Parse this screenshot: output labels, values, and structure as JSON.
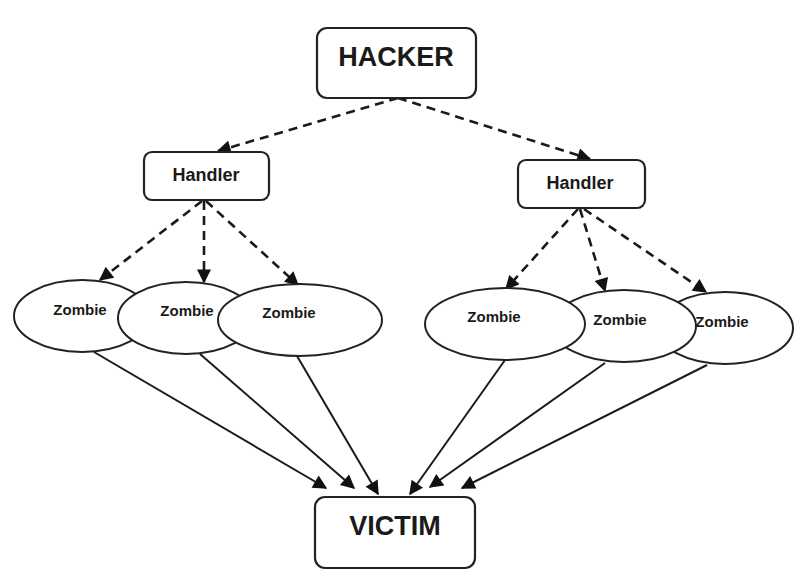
{
  "diagram": {
    "type": "DDoS attack hierarchy",
    "nodes": {
      "hacker": {
        "label": "HACKER"
      },
      "handler_left": {
        "label": "Handler"
      },
      "handler_right": {
        "label": "Handler"
      },
      "zombies_left": [
        {
          "label": "Zombie"
        },
        {
          "label": "Zombie"
        },
        {
          "label": "Zombie"
        }
      ],
      "zombies_right": [
        {
          "label": "Zombie"
        },
        {
          "label": "Zombie"
        },
        {
          "label": "Zombie"
        }
      ],
      "victim": {
        "label": "VICTIM"
      }
    },
    "edges": [
      {
        "from": "HACKER",
        "to": "Handler (left)",
        "style": "dashed"
      },
      {
        "from": "HACKER",
        "to": "Handler (right)",
        "style": "dashed"
      },
      {
        "from": "Handler (left)",
        "to": "Zombie L1",
        "style": "dashed"
      },
      {
        "from": "Handler (left)",
        "to": "Zombie L2",
        "style": "dashed"
      },
      {
        "from": "Handler (left)",
        "to": "Zombie L3",
        "style": "dashed"
      },
      {
        "from": "Handler (right)",
        "to": "Zombie R1",
        "style": "dashed"
      },
      {
        "from": "Handler (right)",
        "to": "Zombie R2",
        "style": "dashed"
      },
      {
        "from": "Handler (right)",
        "to": "Zombie R3",
        "style": "dashed"
      },
      {
        "from": "Zombie L1",
        "to": "VICTIM",
        "style": "solid"
      },
      {
        "from": "Zombie L2",
        "to": "VICTIM",
        "style": "solid"
      },
      {
        "from": "Zombie L3",
        "to": "VICTIM",
        "style": "solid"
      },
      {
        "from": "Zombie R1",
        "to": "VICTIM",
        "style": "solid"
      },
      {
        "from": "Zombie R2",
        "to": "VICTIM",
        "style": "solid"
      },
      {
        "from": "Zombie R3",
        "to": "VICTIM",
        "style": "solid"
      }
    ],
    "colors": {
      "stroke": "#222222",
      "background": "#ffffff"
    }
  }
}
